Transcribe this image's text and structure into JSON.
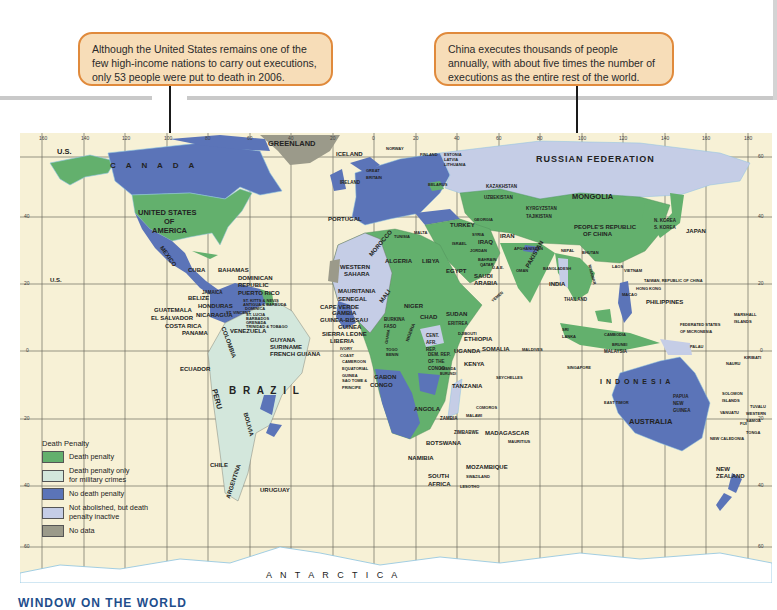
{
  "callouts": [
    {
      "id": "us",
      "text": "Although the United States remains one of the few high-income nations to carry out executions, only 53 people were put to death in 2006."
    },
    {
      "id": "china",
      "text": "China executes thousands of people annually, with about five times the number of executions as the entire rest of the world."
    }
  ],
  "legend": {
    "title": "Death Penalty",
    "items": [
      {
        "label": "Death penalty",
        "color": "#63b06d"
      },
      {
        "label": "Death penalty only for military crimes",
        "color": "#d3e7dc"
      },
      {
        "label": "No death penalty",
        "color": "#5b74b8"
      },
      {
        "label": "Not abolished, but death penalty inactive",
        "color": "#c5cde6"
      },
      {
        "label": "No data",
        "color": "#9b9a8a"
      }
    ]
  },
  "colors": {
    "ocean": "#f7f1d6",
    "grid": "#6b6b5f",
    "coast": "#8cc3e0",
    "callout_fill": "#f7ddb8",
    "callout_border": "#e08a3c"
  },
  "graticule": {
    "longitudes": [
      "160",
      "140",
      "120",
      "100",
      "80",
      "60",
      "40",
      "20",
      "0",
      "20",
      "40",
      "60",
      "80",
      "100",
      "120",
      "140",
      "160",
      "180"
    ],
    "latitudes_right": [
      "60",
      "40",
      "20",
      "0",
      "20",
      "40",
      "60"
    ],
    "latitudes_left": [
      "40",
      "20",
      "0",
      "20",
      "40",
      "60"
    ]
  },
  "labels": {
    "greenland": "GREENLAND",
    "canada": "C A N A D A",
    "us_alaska": "U.S.",
    "us_hawaii": "U.S.",
    "usa": "UNITED STATES OF AMERICA",
    "usa_l1": "UNITED STATES",
    "usa_l2": "OF",
    "usa_l3": "AMERICA",
    "mexico": "MEXICO",
    "cuba": "CUBA",
    "bahamas": "BAHAMAS",
    "dominican": "DOMINICAN REPUBLIC",
    "puerto_rico": "PUERTO RICO",
    "jamaica": "JAMAICA",
    "belize": "BELIZE",
    "honduras": "HONDURAS",
    "guatemala": "GUATEMALA",
    "el_salvador": "EL SALVADOR",
    "nicaragua": "NICARAGUA",
    "costa_rica": "COSTA RICA",
    "panama": "PANAMA",
    "st_kitts": "ST. KITTS & NEVIS",
    "antigua": "ANTIGUA & BARBUDA",
    "dominica": "DOMINICA",
    "st_vincent": "ST. VINCENT",
    "st_lucia": "ST. LUCIA",
    "barbados": "BARBADOS",
    "grenada": "GRENADA",
    "trinidad": "TRINIDAD & TOBAGO",
    "venezuela": "VENEZUELA",
    "guyana": "GUYANA",
    "suriname": "SURINAME",
    "french_guiana": "FRENCH GUIANA",
    "colombia": "COLOMBIA",
    "ecuador": "ECUADOR",
    "peru": "PERU",
    "brazil": "B R A Z I L",
    "bolivia": "BOLIVIA",
    "chile": "CHILE",
    "argentina": "ARGENTINA",
    "uruguay": "URUGUAY",
    "iceland": "ICELAND",
    "ireland": "IRELAND",
    "great_britain": "GREAT BRITAIN",
    "norway": "NORWAY",
    "finland": "FINLAND",
    "estonia": "ESTONIA",
    "latvia": "LATVIA",
    "lithuania": "LITHUANIA",
    "belarus": "BELARUS",
    "portugal": "PORTUGAL",
    "turkey": "TURKEY",
    "russia": "RUSSIAN   FEDERATION",
    "kazakhstan": "KAZAKHSTAN",
    "uzbekistan": "UZBEKISTAN",
    "kyrgyzstan": "KYRGYZSTAN",
    "tajikistan": "TAJIKISTAN",
    "mongolia": "MONGOLIA",
    "china_l1": "PEOPLE'S REPUBLIC",
    "china_l2": "OF CHINA",
    "n_korea": "N. KOREA",
    "s_korea": "S. KOREA",
    "japan": "JAPAN",
    "georgia": "GEORGIA",
    "syria": "SYRIA",
    "iraq": "IRAQ",
    "iran": "IRAN",
    "jordan": "JORDAN",
    "israel": "ISRAEL",
    "tunisia": "TUNISIA",
    "malta": "MALTA",
    "morocco": "MOROCCO",
    "algeria": "ALGERIA",
    "libya": "LIBYA",
    "egypt": "EGYPT",
    "western_sahara_l1": "WESTERN",
    "western_sahara_l2": "SAHARA",
    "mauritania": "MAURITANIA",
    "senegal": "SENEGAL",
    "cape_verde": "CAPE VERDE",
    "gambia": "GAMBIA",
    "guinea_bissau": "GUINEA-BISSAU",
    "guinea": "GUINEA",
    "sierra_leone": "SIERRA LEONE",
    "liberia": "LIBERIA",
    "ivory_coast": "IVORY COAST",
    "mali": "MALI",
    "niger": "NIGER",
    "burkina_faso": "BURKINA FASO",
    "ghana": "GHANA",
    "nigeria": "NIGERIA",
    "togo": "TOGO",
    "benin": "BENIN",
    "chad": "CHAD",
    "sudan": "SUDAN",
    "eritrea": "ERITREA",
    "djibouti": "DJIBOUTI",
    "ethiopia": "ETHIOPIA",
    "somalia": "SOMALIA",
    "cameroon": "CAMEROON",
    "eq_guinea": "EQUATORIAL GUINEA",
    "sao_tome": "SAO TOME & PRINCIPE",
    "gabon": "GABON",
    "congo": "CONGO",
    "car": "CENT. AFR. REP.",
    "drc": "DEM. REP. OF THE CONGO",
    "uganda": "UGANDA",
    "kenya": "KENYA",
    "rwanda": "RWANDA",
    "burundi": "BURUNDI",
    "tanzania": "TANZANIA",
    "angola": "ANGOLA",
    "zambia": "ZAMBIA",
    "malawi": "MALAWI",
    "comoros": "COMOROS",
    "seychelles": "SEYCHELLES",
    "zimbabwe": "ZIMBABWE",
    "botswana": "BOTSWANA",
    "namibia": "NAMIBIA",
    "mozambique": "MOZAMBIQUE",
    "madagascar": "MADAGASCAR",
    "mauritius": "MAURITIUS",
    "swaziland": "SWAZILAND",
    "lesotho": "LESOTHO",
    "south_africa_l1": "SOUTH",
    "south_africa_l2": "AFRICA",
    "saudi_arabia": "SAUDI ARABIA",
    "yemen": "YEMEN",
    "oman": "OMAN",
    "bahrain": "BAHRAIN",
    "qatar": "QATAR",
    "uae": "U.A.E.",
    "afghanistan": "AFGHANISTAN",
    "pakistan": "PAKISTAN",
    "india": "INDIA",
    "nepal": "NEPAL",
    "bhutan": "BHUTAN",
    "bangladesh": "BANGLADESH",
    "myanmar": "MYANMAR",
    "thailand": "THAILAND",
    "laos": "LAOS",
    "vietnam": "VIETNAM",
    "cambodia": "CAMBODIA",
    "sri_lanka": "SRI LANKA",
    "maldives": "MALDIVES",
    "malaysia": "MALAYSIA",
    "brunei": "BRUNEI",
    "singapore": "SINGAPORE",
    "taiwan": "TAIWAN, REPUBLIC OF CHINA",
    "hong_kong": "HONG KONG",
    "macao": "MACAO",
    "philippines": "PHILIPPINES",
    "micronesia": "FEDERATED STATES OF MICRONESIA",
    "marshall": "MARSHALL ISLANDS",
    "palau": "PALAU",
    "nauru": "NAURU",
    "kiribati": "KIRIBATI",
    "indonesia": "I N D O N E S I A",
    "east_timor": "EAST TIMOR",
    "png": "PAPUA NEW GUINEA",
    "solomon": "SOLOMON ISLANDS",
    "tuvalu": "TUVALU",
    "vanuatu": "VANUATU",
    "samoa": "WESTERN SAMOA",
    "fiji": "FIJI",
    "tonga": "TONGA",
    "new_caledonia": "NEW CALEDONIA",
    "australia": "AUSTRALIA",
    "new_zealand_l1": "NEW",
    "new_zealand_l2": "ZEALAND",
    "antarctica": "A N T A R C T I C A"
  },
  "footer": {
    "title": "WINDOW ON THE WORLD"
  }
}
